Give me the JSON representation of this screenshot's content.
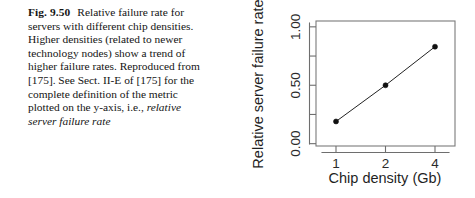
{
  "caption": {
    "figure_label": "Fig. 9.50",
    "body_before_italic": "Relative failure rate for servers with different chip densities. Higher densities (related to newer technology nodes) show a trend of higher failure rates. Reproduced from [175]. See Sect. II-E of [175] for the complete definition of the metric plotted on the y-axis, i.e., ",
    "body_italic": "relative server failure rate"
  },
  "chart_data": {
    "type": "line",
    "title": "",
    "xlabel": "Chip density (Gb)",
    "ylabel": "Relative server failure rate",
    "categories": [
      "1",
      "2",
      "4"
    ],
    "x": [
      1,
      2,
      4
    ],
    "values": [
      0.19,
      0.5,
      0.83
    ],
    "series": [
      {
        "name": "Relative server failure rate",
        "values": [
          0.19,
          0.5,
          0.83
        ]
      }
    ],
    "x_tick_labels": [
      "1",
      "2",
      "4"
    ],
    "y_tick_labels": [
      "0.00",
      "0.50",
      "1.00"
    ],
    "y_tick_values": [
      0.0,
      0.5,
      1.0
    ],
    "y_minor_tick_values": [
      0.25,
      0.75
    ],
    "ylim": [
      -0.02,
      1.05
    ],
    "grid": false,
    "legend": false,
    "marker": "filled-circle",
    "line_color": "#222222",
    "marker_color": "#111111",
    "axis_color": "#6e6e6e"
  }
}
